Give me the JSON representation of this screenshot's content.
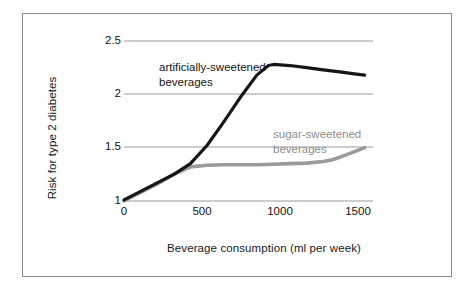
{
  "figure": {
    "background_color": "#ffffff",
    "border_color": "#8a8a8a"
  },
  "chart_data": {
    "type": "line",
    "title": "",
    "xlabel": "Beverage consumption (ml per week)",
    "ylabel": "Risk for type 2 diabetes",
    "xlim": [
      0,
      1500
    ],
    "ylim": [
      1,
      2.5
    ],
    "xticks": [
      0,
      500,
      1000,
      1500
    ],
    "xtick_labels": [
      "0",
      "500",
      "1000",
      "1500"
    ],
    "yticks": [
      1,
      1.5,
      2,
      2.5
    ],
    "ytick_labels": [
      "1",
      "1.5",
      "2",
      "2.5"
    ],
    "grid": true,
    "grid_axis": "y",
    "grid_color": "#9a9a9a",
    "legend_position": "inline-annotations",
    "series": [
      {
        "name": "artificially-sweetened beverages",
        "color": "#161616",
        "linewidth": 3.2,
        "x": [
          0,
          100,
          200,
          300,
          400,
          500,
          600,
          700,
          800,
          870,
          900,
          1000,
          1100,
          1200,
          1300,
          1400,
          1450
        ],
        "values": [
          1.01,
          1.09,
          1.17,
          1.25,
          1.35,
          1.52,
          1.74,
          1.97,
          2.18,
          2.27,
          2.28,
          2.27,
          2.25,
          2.23,
          2.21,
          2.19,
          2.18
        ]
      },
      {
        "name": "sugar-sweetened beverages",
        "color": "#9a9a9a",
        "linewidth": 3.6,
        "x": [
          0,
          100,
          200,
          300,
          400,
          500,
          600,
          700,
          800,
          900,
          1000,
          1100,
          1200,
          1250,
          1300,
          1350,
          1400,
          1450
        ],
        "values": [
          1.0,
          1.08,
          1.16,
          1.25,
          1.32,
          1.335,
          1.34,
          1.34,
          1.34,
          1.345,
          1.35,
          1.355,
          1.37,
          1.385,
          1.41,
          1.44,
          1.47,
          1.5
        ]
      }
    ],
    "annotations": [
      {
        "name": "artificially-sweetened-label",
        "text_line1": "artificially-sweetened",
        "text_line2": "beverages",
        "color": "#161616"
      },
      {
        "name": "sugar-sweetened-label",
        "text_line1": "sugar-sweetened",
        "text_line2": "beverages",
        "color": "#8c8c8c"
      }
    ]
  }
}
